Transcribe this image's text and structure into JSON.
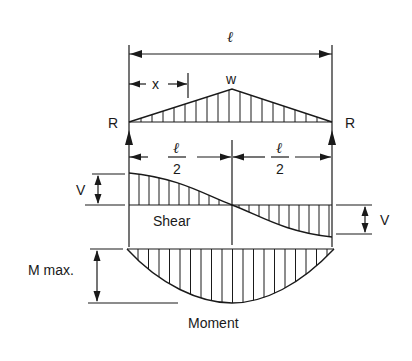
{
  "diagram": {
    "labels": {
      "span": "ℓ",
      "distance_x": "x",
      "load": "w",
      "reaction_left": "R",
      "reaction_right": "R",
      "half_span_num_left": "ℓ",
      "half_span_den_left": "2",
      "half_span_num_right": "ℓ",
      "half_span_den_right": "2",
      "shear_left": "V",
      "shear_right": "V",
      "shear_caption": "Shear",
      "moment_max": "M max.",
      "moment_caption": "Moment"
    },
    "colors": {
      "ink": "#1a1a1a",
      "background": "#ffffff"
    }
  }
}
